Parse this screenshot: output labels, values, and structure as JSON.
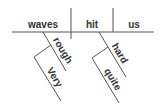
{
  "diagram": {
    "type": "sentence-diagram",
    "sentence": "Very rough waves hit us quite hard",
    "subject": "waves",
    "verb": "hit",
    "object": "us",
    "modifiers": {
      "subject_modifier": "rough",
      "subject_modifier_modifier": "Very",
      "verb_modifier": "hard",
      "verb_modifier_modifier": "quite"
    },
    "colors": {
      "line": "#555555",
      "text": "#333333",
      "background": "#ffffff"
    }
  }
}
